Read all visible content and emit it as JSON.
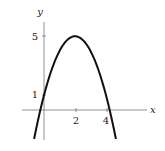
{
  "chart_data": {
    "type": "line",
    "title": "",
    "xlabel": "x",
    "ylabel": "y",
    "function": "y = -(x-2)^2 + 5",
    "series": [
      {
        "name": "parabola",
        "x": [
          -0.64,
          -0.24,
          0,
          0.5,
          1,
          1.5,
          2,
          2.5,
          3,
          3.5,
          4,
          4.24,
          4.64
        ],
        "values": [
          -1.97,
          0,
          1,
          2.75,
          4,
          4.75,
          5,
          4.75,
          4,
          2.75,
          1,
          0,
          -1.97
        ]
      }
    ],
    "x_ticks": [
      "2",
      "4"
    ],
    "y_ticks": [
      "1",
      "5"
    ],
    "xlim": [
      -1.1,
      6.2
    ],
    "ylim": [
      -2.2,
      6.3
    ],
    "grid": false,
    "legend": "none",
    "colors": {
      "curve": "#111111",
      "axis": "#777777"
    }
  }
}
